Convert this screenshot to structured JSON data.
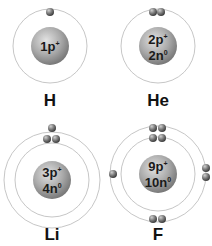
{
  "colors": {
    "orbit": "#b8b8b8",
    "nucleus_light": "#dcdcdc",
    "nucleus_dark": "#8a8a8a",
    "electron_light": "#bdbdbd",
    "electron_dark": "#4a4a4a"
  },
  "atoms": [
    {
      "symbol": "H",
      "protons": "1p",
      "proton_sup": "+",
      "neutrons": "",
      "neutron_sup": "",
      "shells": [
        1
      ]
    },
    {
      "symbol": "He",
      "protons": "2p",
      "proton_sup": "+",
      "neutrons": "2n",
      "neutron_sup": "0",
      "shells": [
        2
      ]
    },
    {
      "symbol": "Li",
      "protons": "3p",
      "proton_sup": "+",
      "neutrons": "4n",
      "neutron_sup": "0",
      "shells": [
        2,
        1
      ]
    },
    {
      "symbol": "F",
      "protons": "9p",
      "proton_sup": "+",
      "neutrons": "10n",
      "neutron_sup": "0",
      "shells": [
        2,
        7
      ]
    }
  ]
}
